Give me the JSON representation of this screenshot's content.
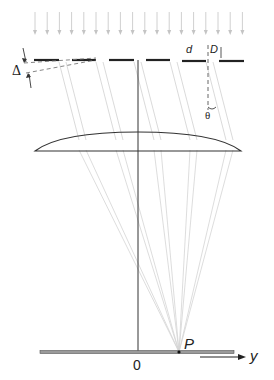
{
  "diagram": {
    "title": "",
    "labels": {
      "delta": "Δ",
      "d": "d",
      "D": "D",
      "theta": "θ",
      "origin": "0",
      "point": "P",
      "axis": "y"
    },
    "components": {
      "incident_light": "parallel incident rays (downward arrows)",
      "grating": "slit array with segments of width d, gap D, step offset Δ",
      "lens": "plano-convex converging lens",
      "optical_axis": "vertical line through lens center",
      "screen": "focal-plane screen with y axis",
      "diffracted_rays": "rays inclined at angle θ converging to P"
    },
    "colors": {
      "line": "#222222",
      "ray": "#cfcfcf",
      "arrow": "#bdbdbd",
      "screen_fill": "#9a9a9a"
    }
  }
}
